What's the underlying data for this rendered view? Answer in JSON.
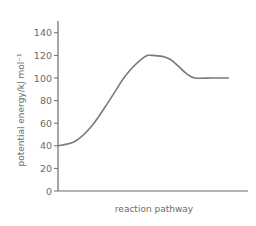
{
  "chart_data": {
    "type": "line",
    "title": "",
    "xlabel": "reaction pathway",
    "ylabel": "potential energy/kJ mol⁻¹",
    "ylim": [
      0,
      150
    ],
    "yticks": [
      0,
      20,
      40,
      60,
      80,
      100,
      120,
      140
    ],
    "xticks": [],
    "grid": false,
    "legend": null,
    "series": [
      {
        "name": "energy profile",
        "description": "reactants at 40, activation peak at 120, products plateau at 100",
        "x": [
          0,
          0.1,
          0.2,
          0.3,
          0.4,
          0.5,
          0.55,
          0.65,
          0.75,
          0.8,
          0.9,
          1.0
        ],
        "y": [
          40,
          44,
          58,
          80,
          103,
          118,
          120,
          117,
          104,
          100,
          100,
          100
        ]
      }
    ],
    "key_points": {
      "reactants_energy": 40,
      "transition_state_energy": 120,
      "products_energy": 100
    },
    "colors": {
      "axis": "#6b6b6b",
      "curve": "#7a7a7a",
      "text": "#6b6b6b"
    }
  }
}
